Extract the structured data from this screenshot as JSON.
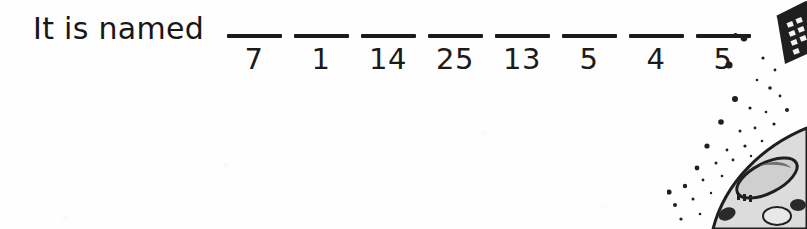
{
  "worksheet": {
    "prompt_text": "It is named",
    "end_punctuation": ".",
    "blanks": [
      {
        "code": "7",
        "answer_value": ""
      },
      {
        "code": "1",
        "answer_value": ""
      },
      {
        "code": "14",
        "answer_value": ""
      },
      {
        "code": "25",
        "answer_value": ""
      },
      {
        "code": "13",
        "answer_value": ""
      },
      {
        "code": "5",
        "answer_value": ""
      },
      {
        "code": "4",
        "answer_value": ""
      },
      {
        "code": "5",
        "answer_value": ""
      }
    ],
    "blank_count": 8
  },
  "illustration": {
    "name": "spacecraft-and-starfield",
    "description": "Black and white line art of a solar panel array at upper right and a curved spacecraft hull with an oval hatch at lower right, surrounded by scattered dark specks",
    "ink_color": "#1b1b1b",
    "hull_fill": "#d8d8d8",
    "shadow_fill": "#8f8f8f"
  },
  "page": {
    "background_color": "#fefefe",
    "text_color": "#1b1b1b"
  }
}
